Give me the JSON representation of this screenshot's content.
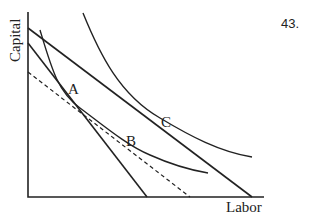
{
  "problem_number": "43.",
  "axes": {
    "x_label": "Labor",
    "y_label": "Capital"
  },
  "points": [
    {
      "label": "A"
    },
    {
      "label": "B"
    },
    {
      "label": "C"
    }
  ],
  "elements": {
    "budget_lines": [
      "outer isocost (tangent at C)",
      "inner isocost (tangent at A)"
    ],
    "dashed_line": "hypothetical isocost parallel to outer, tangent at B",
    "isoquants": [
      "lower isoquant through A and B",
      "higher isoquant through C"
    ]
  }
}
